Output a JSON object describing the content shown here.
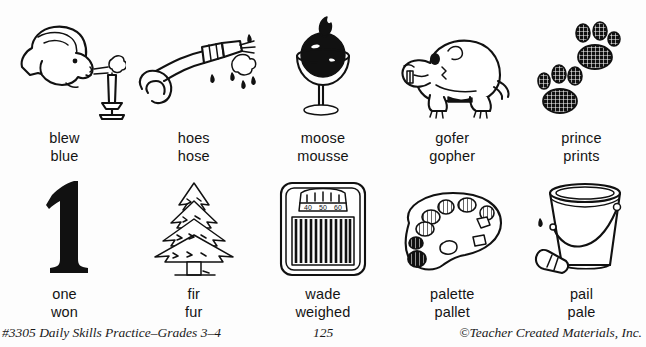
{
  "worksheet": {
    "rows": [
      {
        "cells": [
          {
            "illustration": "person-blowing-candle-icon",
            "words": [
              "blew",
              "blue"
            ]
          },
          {
            "illustration": "garden-hose-spraying-icon",
            "words": [
              "hoes",
              "hose"
            ]
          },
          {
            "illustration": "dessert-mousse-glass-icon",
            "words": [
              "moose",
              "mousse"
            ]
          },
          {
            "illustration": "gopher-icon",
            "words": [
              "gofer",
              "gopher"
            ]
          },
          {
            "illustration": "paw-prints-icon",
            "words": [
              "prince",
              "prints"
            ]
          }
        ]
      },
      {
        "cells": [
          {
            "illustration": "numeral-one-icon",
            "words": [
              "one",
              "won"
            ]
          },
          {
            "illustration": "fir-tree-icon",
            "words": [
              "fir",
              "fur"
            ]
          },
          {
            "illustration": "bathroom-scale-icon",
            "words": [
              "wade",
              "weighed"
            ]
          },
          {
            "illustration": "artist-palette-icon",
            "words": [
              "palette",
              "pallet"
            ]
          },
          {
            "illustration": "pail-bucket-icon",
            "words": [
              "pail",
              "pale"
            ]
          }
        ]
      }
    ]
  },
  "footer": {
    "left": "#3305 Daily Skills Practice–Grades 3–4",
    "page_number": "125",
    "right": "©Teacher Created Materials, Inc."
  },
  "colors": {
    "ink": "#111111",
    "paper": "#fdfdfd"
  }
}
